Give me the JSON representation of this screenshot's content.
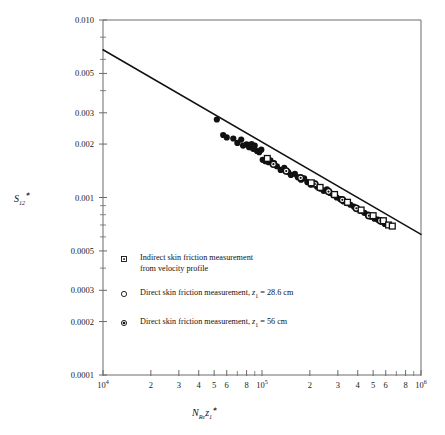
{
  "chart_data": {
    "type": "scatter",
    "title": "",
    "xlabel": "N_Re z_1*",
    "ylabel": "S*_12",
    "xscale": "log",
    "yscale": "log",
    "xlim": [
      10000,
      1000000
    ],
    "ylim": [
      0.0001,
      0.01
    ],
    "grid": false,
    "legend_position": "inside-lower-left",
    "x_tick_labels": [
      "10⁴",
      "2",
      "3",
      "4",
      "5",
      "6",
      "8",
      "10⁵",
      "2",
      "3",
      "4",
      "5",
      "6",
      "8",
      "10⁶"
    ],
    "x_tick_values": [
      10000,
      20000,
      30000,
      40000,
      50000,
      60000,
      80000,
      100000,
      200000,
      300000,
      400000,
      500000,
      600000,
      800000,
      1000000
    ],
    "x_minor_values": [
      70000,
      90000,
      700000,
      900000
    ],
    "y_tick_labels": [
      "0.010",
      "0.005",
      "0.003",
      "0.002",
      "0.001",
      "0.0005",
      "0.0003",
      "0.0002",
      "0.0001"
    ],
    "y_tick_values": [
      0.01,
      0.005,
      0.003,
      0.002,
      0.001,
      0.0005,
      0.0003,
      0.0002,
      0.0001
    ],
    "y_minor_values": [
      0.008,
      0.006,
      0.004,
      0.0009,
      0.0008,
      0.0007,
      0.0006,
      0.0004
    ],
    "fit_line": {
      "name": "correlation line",
      "x": [
        10000,
        1000000
      ],
      "y": [
        0.0068,
        0.00062
      ],
      "color": "#111111"
    },
    "series": [
      {
        "name": "Direct skin friction measurement, z1 = 56 cm",
        "marker": "filled-circle",
        "color": "#111111",
        "points": [
          [
            52000,
            0.00275
          ],
          [
            57000,
            0.00225
          ],
          [
            60000,
            0.00218
          ],
          [
            66000,
            0.00215
          ],
          [
            70000,
            0.00203
          ],
          [
            74000,
            0.00212
          ],
          [
            76000,
            0.00196
          ],
          [
            80000,
            0.00199
          ],
          [
            83000,
            0.00192
          ],
          [
            86000,
            0.002
          ],
          [
            88000,
            0.00188
          ],
          [
            90000,
            0.00196
          ],
          [
            93000,
            0.00183
          ],
          [
            96000,
            0.0018
          ],
          [
            99000,
            0.00186
          ],
          [
            101000,
            0.00163
          ],
          [
            105000,
            0.0016
          ],
          [
            110000,
            0.00158
          ],
          [
            113000,
            0.00162
          ],
          [
            119000,
            0.00156
          ],
          [
            124000,
            0.0015
          ],
          [
            131000,
            0.00143
          ],
          [
            138000,
            0.00147
          ],
          [
            146000,
            0.00139
          ],
          [
            152000,
            0.00134
          ],
          [
            161000,
            0.00136
          ],
          [
            168000,
            0.0013
          ],
          [
            176000,
            0.00126
          ],
          [
            184000,
            0.00128
          ],
          [
            193000,
            0.00122
          ],
          [
            203000,
            0.00118
          ],
          [
            212000,
            0.0012
          ],
          [
            222000,
            0.00115
          ],
          [
            233000,
            0.00112
          ],
          [
            244000,
            0.00109
          ],
          [
            256000,
            0.00111
          ],
          [
            268000,
            0.00106
          ],
          [
            281000,
            0.00103
          ],
          [
            295000,
            0.001
          ],
          [
            310000,
            0.00098
          ],
          [
            326000,
            0.00095
          ],
          [
            342000,
            0.00093
          ],
          [
            360000,
            0.00091
          ],
          [
            378000,
            0.00089
          ],
          [
            398000,
            0.00086
          ],
          [
            418000,
            0.00084
          ],
          [
            440000,
            0.00082
          ],
          [
            462000,
            0.0008
          ],
          [
            486000,
            0.00078
          ],
          [
            510000,
            0.00076
          ],
          [
            536000,
            0.00075
          ],
          [
            564000,
            0.00073
          ],
          [
            592000,
            0.00071
          ]
        ]
      },
      {
        "name": "Direct skin friction measurement, z1 = 28.6 cm",
        "marker": "dot-circle",
        "color": "#111111",
        "points": [
          [
            118000,
            0.00154
          ],
          [
            142000,
            0.00141
          ],
          [
            175000,
            0.00129
          ],
          [
            215000,
            0.00119
          ],
          [
            262000,
            0.00108
          ],
          [
            320000,
            0.00097
          ],
          [
            392000,
            0.00087
          ],
          [
            470000,
            0.00079
          ],
          [
            555000,
            0.00074
          ]
        ]
      },
      {
        "name": "Indirect skin friction measurement from velocity profile",
        "marker": "open-square",
        "color": "#111111",
        "points": [
          [
            108000,
            0.00166
          ],
          [
            204000,
            0.00121
          ],
          [
            232000,
            0.00114
          ],
          [
            286000,
            0.00104
          ],
          [
            345000,
            0.00094
          ],
          [
            420000,
            0.00085
          ],
          [
            500000,
            0.00079
          ],
          [
            580000,
            0.00074
          ],
          [
            625000,
            0.0007
          ],
          [
            660000,
            0.00069
          ]
        ]
      }
    ],
    "legend": [
      {
        "marker": "open-square",
        "lines": [
          "Indirect skin friction measurement",
          "from velocity profile"
        ]
      },
      {
        "marker": "open-circle",
        "lines": [
          "Direct skin friction measurement, z₁ = 28.6 cm"
        ]
      },
      {
        "marker": "dot-circle",
        "lines": [
          "Direct skin friction measurement, z₁ = 56 cm"
        ]
      }
    ]
  },
  "axis_labels": {
    "y_main": "S",
    "y_sub": "12",
    "y_star": "∗",
    "x_n": "N",
    "x_re": "Re",
    "x_z": "z",
    "x_one": "1",
    "x_star": "∗"
  },
  "legend_text": {
    "item1_line1": "Indirect skin friction measurement",
    "item1_line2": "from velocity profile",
    "item2_a": "Direct skin friction measurement, ",
    "item2_z": "z",
    "item2_sub": "1",
    "item2_b": " = 28.6 cm",
    "item3_a": "Direct skin friction measurement, ",
    "item3_z": "z",
    "item3_sub": "1",
    "item3_b": " = 56 cm"
  },
  "colors": {
    "frame": "#6a6a6a",
    "ink": "#111111",
    "background": "#ffffff"
  }
}
